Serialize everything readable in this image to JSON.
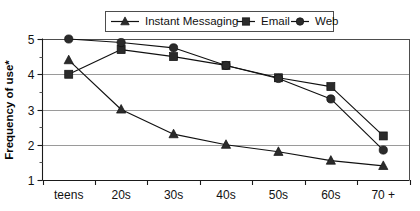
{
  "chart_data": {
    "type": "line",
    "title": "",
    "xlabel": "",
    "ylabel": "Frequency of use*",
    "categories": [
      "teens",
      "20s",
      "30s",
      "40s",
      "50s",
      "60s",
      "70 +"
    ],
    "ylim": [
      1,
      5
    ],
    "yticks": [
      1,
      2,
      3,
      4,
      5
    ],
    "ytick_labels": [
      "1",
      "2",
      "3",
      "4",
      "5"
    ],
    "minor_ticks": true,
    "grid": "horizontal",
    "legend_position": "top-center",
    "series": [
      {
        "name": "Instant Messaging",
        "marker": "triangle",
        "color": "#2b2b2b",
        "values": [
          4.4,
          3.0,
          2.3,
          2.0,
          1.8,
          1.55,
          1.4
        ]
      },
      {
        "name": "Email",
        "marker": "square",
        "color": "#4a4a4a",
        "values": [
          4.0,
          4.7,
          4.5,
          4.25,
          3.9,
          3.65,
          2.25
        ]
      },
      {
        "name": "Web",
        "marker": "circle",
        "color": "#1f1f1f",
        "values": [
          5.0,
          4.9,
          4.75,
          4.25,
          3.88,
          3.3,
          1.85
        ]
      }
    ]
  },
  "legend": {
    "items": [
      {
        "label": "Instant Messaging"
      },
      {
        "label": "Email"
      },
      {
        "label": "Web"
      }
    ]
  },
  "axes": {
    "y_title": "Frequency of use*",
    "y_labels": [
      "5",
      "4",
      "3",
      "2",
      "1"
    ],
    "x_labels": [
      "teens",
      "20s",
      "30s",
      "40s",
      "50s",
      "60s",
      "70 +"
    ]
  }
}
